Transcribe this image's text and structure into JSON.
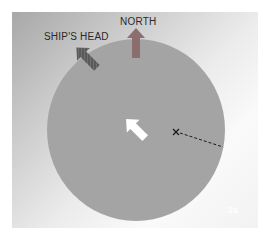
{
  "diagram": {
    "labels": {
      "north": "NORTH",
      "ships_head": "SHIP'S HEAD",
      "figure_id": "2a"
    },
    "colors": {
      "circle_fill": "#a4a4a4",
      "north_arrow": "#8c6e6e",
      "ships_head_arrow": "#5a5a5a",
      "center_arrow": "#ffffff",
      "marker": "#1a1a1a"
    },
    "elements": [
      {
        "type": "circle",
        "name": "compass-disc"
      },
      {
        "type": "arrow",
        "name": "north-arrow",
        "direction": "up"
      },
      {
        "type": "arrow",
        "name": "ships-head-arrow",
        "direction": "up-left"
      },
      {
        "type": "arrow",
        "name": "center-arrow",
        "direction": "up-left"
      },
      {
        "type": "marker",
        "name": "x-marker",
        "glyph": "×"
      },
      {
        "type": "dashed-line",
        "name": "radius-line"
      }
    ]
  }
}
